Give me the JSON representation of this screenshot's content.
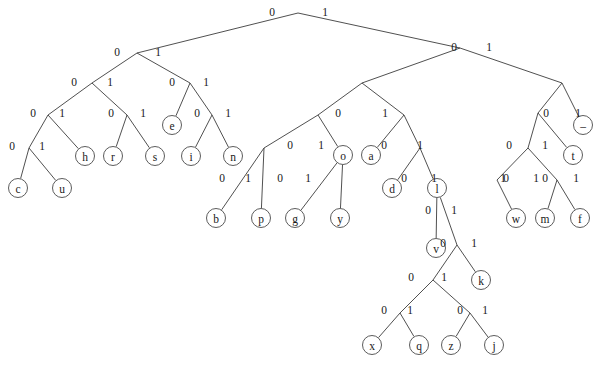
{
  "figure": {
    "type": "binary-tree-diagram",
    "background_color": "#ffffff",
    "line_color": "#3c3c3c",
    "node_fill": "#ffffff",
    "node_stroke": "#4a4a4a",
    "text_color": "#1a1a1a",
    "width": 604,
    "height": 368,
    "leaf_radius": 9.5,
    "edge_label_values": [
      "0",
      "1"
    ]
  },
  "tree": {
    "nodes": [
      {
        "id": "root",
        "x": 298,
        "y": 13,
        "type": "internal",
        "label": ""
      },
      {
        "id": "n0",
        "x": 137,
        "y": 53,
        "type": "internal",
        "label": ""
      },
      {
        "id": "n1",
        "x": 460,
        "y": 48,
        "type": "internal",
        "label": ""
      },
      {
        "id": "n00",
        "x": 92,
        "y": 83,
        "type": "internal",
        "label": ""
      },
      {
        "id": "n01",
        "x": 190,
        "y": 83,
        "type": "internal",
        "label": ""
      },
      {
        "id": "n10",
        "x": 362,
        "y": 83,
        "type": "internal",
        "label": ""
      },
      {
        "id": "n11",
        "x": 562,
        "y": 83,
        "type": "internal",
        "label": ""
      },
      {
        "id": "n000",
        "x": 48,
        "y": 115,
        "type": "internal",
        "label": ""
      },
      {
        "id": "n001",
        "x": 127,
        "y": 115,
        "type": "internal",
        "label": ""
      },
      {
        "id": "n010",
        "x": 172,
        "y": 125,
        "type": "leaf",
        "label": "e"
      },
      {
        "id": "n011",
        "x": 212,
        "y": 115,
        "type": "internal",
        "label": ""
      },
      {
        "id": "n100",
        "x": 318,
        "y": 115,
        "type": "internal",
        "label": ""
      },
      {
        "id": "n101",
        "x": 404,
        "y": 115,
        "type": "internal",
        "label": ""
      },
      {
        "id": "n110",
        "x": 538,
        "y": 113,
        "type": "internal",
        "label": ""
      },
      {
        "id": "n111",
        "x": 583,
        "y": 125,
        "type": "leaf",
        "label": "–"
      },
      {
        "id": "n0000",
        "x": 29,
        "y": 148,
        "type": "internal",
        "label": ""
      },
      {
        "id": "n0001",
        "x": 85,
        "y": 156,
        "type": "leaf",
        "label": "h"
      },
      {
        "id": "n0010",
        "x": 113,
        "y": 156,
        "type": "leaf",
        "label": "r"
      },
      {
        "id": "n0011",
        "x": 155,
        "y": 156,
        "type": "leaf",
        "label": "s"
      },
      {
        "id": "n0110",
        "x": 191,
        "y": 156,
        "type": "leaf",
        "label": "i"
      },
      {
        "id": "n0111",
        "x": 233,
        "y": 156,
        "type": "leaf",
        "label": "n"
      },
      {
        "id": "n1000",
        "x": 264,
        "y": 148,
        "type": "internal",
        "label": ""
      },
      {
        "id": "n1001",
        "x": 343,
        "y": 155,
        "type": "leaf",
        "label": "o"
      },
      {
        "id": "n1010",
        "x": 371,
        "y": 155,
        "type": "leaf",
        "label": "a"
      },
      {
        "id": "n1011",
        "x": 420,
        "y": 148,
        "type": "internal",
        "label": ""
      },
      {
        "id": "n1100",
        "x": 528,
        "y": 148,
        "type": "internal",
        "label": ""
      },
      {
        "id": "n1101",
        "x": 573,
        "y": 155,
        "type": "leaf",
        "label": "t"
      },
      {
        "id": "c",
        "x": 18,
        "y": 188,
        "type": "leaf",
        "label": "c"
      },
      {
        "id": "u",
        "x": 62,
        "y": 188,
        "type": "leaf",
        "label": "u"
      },
      {
        "id": "n10000",
        "x": 238,
        "y": 180,
        "type": "internal",
        "label": ""
      },
      {
        "id": "n10001",
        "x": 297,
        "y": 180,
        "type": "internal",
        "label": ""
      },
      {
        "id": "d",
        "x": 392,
        "y": 188,
        "type": "leaf",
        "label": "d"
      },
      {
        "id": "l",
        "x": 437,
        "y": 188,
        "type": "internal",
        "label": "l"
      },
      {
        "id": "n11000",
        "x": 497,
        "y": 180,
        "type": "internal",
        "label": ""
      },
      {
        "id": "w",
        "x": 516,
        "y": 218,
        "type": "leaf",
        "label": "w"
      },
      {
        "id": "n11001",
        "x": 557,
        "y": 180,
        "type": "internal",
        "label": ""
      },
      {
        "id": "m",
        "x": 545,
        "y": 218,
        "type": "leaf",
        "label": "m"
      },
      {
        "id": "f",
        "x": 580,
        "y": 218,
        "type": "leaf",
        "label": "f"
      },
      {
        "id": "b",
        "x": 216,
        "y": 218,
        "type": "leaf",
        "label": "b"
      },
      {
        "id": "p",
        "x": 261,
        "y": 218,
        "type": "leaf",
        "label": "p"
      },
      {
        "id": "g",
        "x": 295,
        "y": 218,
        "type": "leaf",
        "label": "g"
      },
      {
        "id": "y",
        "x": 340,
        "y": 218,
        "type": "leaf",
        "label": "y"
      },
      {
        "id": "v",
        "x": 436,
        "y": 248,
        "type": "leaf",
        "label": "v"
      },
      {
        "id": "n1l1",
        "x": 457,
        "y": 245,
        "type": "internal",
        "label": ""
      },
      {
        "id": "k",
        "x": 481,
        "y": 280,
        "type": "leaf",
        "label": "k"
      },
      {
        "id": "n1l10",
        "x": 433,
        "y": 280,
        "type": "internal",
        "label": ""
      },
      {
        "id": "n1l100",
        "x": 400,
        "y": 313,
        "type": "internal",
        "label": ""
      },
      {
        "id": "n1l101",
        "x": 470,
        "y": 313,
        "type": "internal",
        "label": ""
      },
      {
        "id": "x",
        "x": 372,
        "y": 345,
        "type": "leaf",
        "label": "x"
      },
      {
        "id": "q",
        "x": 419,
        "y": 345,
        "type": "leaf",
        "label": "q"
      },
      {
        "id": "z",
        "x": 451,
        "y": 345,
        "type": "leaf",
        "label": "z"
      },
      {
        "id": "j",
        "x": 494,
        "y": 345,
        "type": "leaf",
        "label": "j"
      }
    ],
    "edges": [
      {
        "from": "root",
        "to": "n0",
        "bit": "0",
        "lx": 272,
        "ly": 12
      },
      {
        "from": "root",
        "to": "n1",
        "bit": "1",
        "lx": 325,
        "ly": 12
      },
      {
        "from": "n0",
        "to": "n00",
        "bit": "0",
        "lx": 117,
        "ly": 52
      },
      {
        "from": "n0",
        "to": "n01",
        "bit": "1",
        "lx": 158,
        "ly": 52
      },
      {
        "from": "n1",
        "to": "n10",
        "bit": "0",
        "lx": 454,
        "ly": 47
      },
      {
        "from": "n1",
        "to": "n11",
        "bit": "1",
        "lx": 489,
        "ly": 47
      },
      {
        "from": "n00",
        "to": "n000",
        "bit": "0",
        "lx": 74,
        "ly": 82
      },
      {
        "from": "n00",
        "to": "n001",
        "bit": "1",
        "lx": 110,
        "ly": 82
      },
      {
        "from": "n01",
        "to": "n010",
        "bit": "0",
        "lx": 172,
        "ly": 82
      },
      {
        "from": "n01",
        "to": "n011",
        "bit": "1",
        "lx": 206,
        "ly": 82
      },
      {
        "from": "n10",
        "to": "n100",
        "bit": "0",
        "lx": 338,
        "ly": 113
      },
      {
        "from": "n10",
        "to": "n101",
        "bit": "1",
        "lx": 385,
        "ly": 113
      },
      {
        "from": "n11",
        "to": "n110",
        "bit": "0",
        "lx": 546,
        "ly": 113
      },
      {
        "from": "n11",
        "to": "n111",
        "bit": "1",
        "lx": 578,
        "ly": 113
      },
      {
        "from": "n000",
        "to": "n0000",
        "bit": "0",
        "lx": 33,
        "ly": 113
      },
      {
        "from": "n000",
        "to": "n0001",
        "bit": "1",
        "lx": 62,
        "ly": 113
      },
      {
        "from": "n001",
        "to": "n0010",
        "bit": "0",
        "lx": 111,
        "ly": 113
      },
      {
        "from": "n001",
        "to": "n0011",
        "bit": "1",
        "lx": 143,
        "ly": 113
      },
      {
        "from": "n011",
        "to": "n0110",
        "bit": "0",
        "lx": 197,
        "ly": 113
      },
      {
        "from": "n011",
        "to": "n0111",
        "bit": "1",
        "lx": 228,
        "ly": 113
      },
      {
        "from": "n0000",
        "to": "c",
        "bit": "0",
        "lx": 12,
        "ly": 146
      },
      {
        "from": "n0000",
        "to": "u",
        "bit": "1",
        "lx": 42,
        "ly": 146
      },
      {
        "from": "n100",
        "to": "n1000",
        "bit": "0",
        "lx": 290,
        "ly": 145
      },
      {
        "from": "n100",
        "to": "n1001",
        "bit": "1",
        "lx": 321,
        "ly": 145
      },
      {
        "from": "n101",
        "to": "n1010",
        "bit": "0",
        "lx": 384,
        "ly": 145
      },
      {
        "from": "n101",
        "to": "n1011",
        "bit": "1",
        "lx": 420,
        "ly": 145
      },
      {
        "from": "n110",
        "to": "n1100",
        "bit": "0",
        "lx": 509,
        "ly": 145
      },
      {
        "from": "n110",
        "to": "n1101",
        "bit": "1",
        "lx": 545,
        "ly": 145
      },
      {
        "from": "n1000",
        "to": "b",
        "bit": "0",
        "lx": 222,
        "ly": 178
      },
      {
        "from": "n1000",
        "to": "p",
        "bit": "1",
        "lx": 248,
        "ly": 178
      },
      {
        "from": "n1001",
        "to": "g",
        "bit": "0",
        "lx": 280,
        "ly": 178
      },
      {
        "from": "n1001",
        "to": "y",
        "bit": "1",
        "lx": 308,
        "ly": 178
      },
      {
        "from": "n1011",
        "to": "d",
        "bit": "0",
        "lx": 404,
        "ly": 178
      },
      {
        "from": "n1011",
        "to": "l",
        "bit": "1",
        "lx": 434,
        "ly": 178
      },
      {
        "from": "n1100",
        "to": "n11000",
        "bit": "0",
        "lx": 506,
        "ly": 178
      },
      {
        "from": "n1100",
        "to": "n11001",
        "bit": "1",
        "lx": 536,
        "ly": 178
      },
      {
        "from": "n11000",
        "to": "w",
        "bit": "1",
        "lx": 503,
        "ly": 178
      },
      {
        "from": "n11001",
        "to": "m",
        "bit": "0",
        "lx": 545,
        "ly": 178
      },
      {
        "from": "n11001",
        "to": "f",
        "bit": "1",
        "lx": 576,
        "ly": 178
      },
      {
        "from": "l",
        "to": "v",
        "bit": "0",
        "lx": 428,
        "ly": 210
      },
      {
        "from": "l",
        "to": "n1l1",
        "bit": "1",
        "lx": 454,
        "ly": 210
      },
      {
        "from": "n1l1",
        "to": "n1l10",
        "bit": "0",
        "lx": 443,
        "ly": 243
      },
      {
        "from": "n1l1",
        "to": "k",
        "bit": "1",
        "lx": 474,
        "ly": 243
      },
      {
        "from": "n1l10",
        "to": "n1l100",
        "bit": "0",
        "lx": 411,
        "ly": 277
      },
      {
        "from": "n1l10",
        "to": "n1l101",
        "bit": "1",
        "lx": 444,
        "ly": 277
      },
      {
        "from": "n1l100",
        "to": "x",
        "bit": "0",
        "lx": 384,
        "ly": 310
      },
      {
        "from": "n1l100",
        "to": "q",
        "bit": "1",
        "lx": 410,
        "ly": 310
      },
      {
        "from": "n1l101",
        "to": "z",
        "bit": "0",
        "lx": 460,
        "ly": 310
      },
      {
        "from": "n1l101",
        "to": "j",
        "bit": "1",
        "lx": 485,
        "ly": 310
      }
    ]
  }
}
